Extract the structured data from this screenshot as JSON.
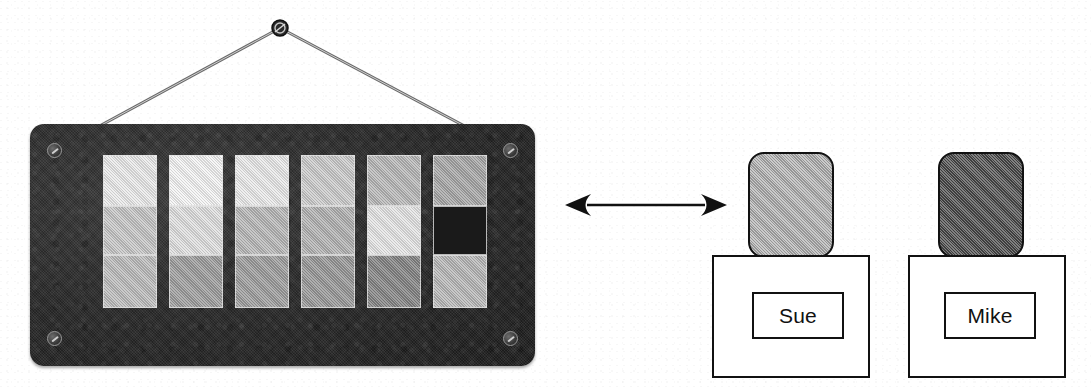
{
  "scene": {
    "title": "Feature comparison board with two labeled persons",
    "background_color": "#ffffff"
  },
  "board": {
    "name": "hanging-chart-board",
    "frame_color": "#2a2a2a",
    "x": 30,
    "y": 124,
    "width": 505,
    "height": 242,
    "hook": {
      "name": "hanging-hook",
      "cx": 280,
      "cy": 28,
      "r": 8,
      "color": "#2b2b2b"
    },
    "wire_color": "#555555",
    "screws": [
      {
        "name": "screw-top-left",
        "x": 17,
        "y": 19
      },
      {
        "name": "screw-top-right",
        "x": 473,
        "y": 19
      },
      {
        "name": "screw-bottom-left",
        "x": 17,
        "y": 207
      },
      {
        "name": "screw-bottom-right",
        "x": 473,
        "y": 207
      }
    ],
    "grid": {
      "name": "shade-grid",
      "columns": 6,
      "rows": 3,
      "origin_x": 73,
      "origin_y": 31,
      "cell_width": 54,
      "row_heights": [
        51,
        49,
        53
      ],
      "col_gap": 12,
      "values": [
        [
          0.92,
          0.78,
          0.74
        ],
        [
          0.96,
          0.88,
          0.62
        ],
        [
          0.92,
          0.72,
          0.62
        ],
        [
          0.8,
          0.7,
          0.6
        ],
        [
          0.72,
          0.9,
          0.52
        ],
        [
          0.66,
          0.1,
          0.72
        ]
      ]
    }
  },
  "arrow": {
    "name": "bidirectional-arrow",
    "x": 565,
    "y": 192,
    "width": 162,
    "height": 26,
    "color": "#111111",
    "direction": "both"
  },
  "people": [
    {
      "name": "person-sue",
      "label": "Sue",
      "head": {
        "x": 748,
        "y": 152,
        "width": 86,
        "height": 106,
        "fill": "#b4b4b4"
      },
      "body": {
        "x": 712,
        "y": 255,
        "width": 158,
        "height": 123,
        "fill": "#ffffff"
      },
      "name_box": {
        "x": 752,
        "y": 292,
        "width": 92,
        "height": 47
      },
      "group_x": 0
    },
    {
      "name": "person-mike",
      "label": "Mike",
      "head": {
        "x": 938,
        "y": 152,
        "width": 86,
        "height": 106,
        "fill": "#4a4a4a"
      },
      "body": {
        "x": 908,
        "y": 255,
        "width": 158,
        "height": 123,
        "fill": "#ffffff"
      },
      "name_box": {
        "x": 944,
        "y": 292,
        "width": 92,
        "height": 47
      },
      "group_x": 0
    }
  ]
}
